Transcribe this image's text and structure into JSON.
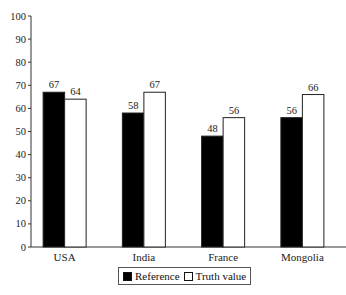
{
  "chart_data": {
    "type": "bar",
    "title": "",
    "xlabel": "",
    "ylabel": "",
    "categories": [
      "USA",
      "India",
      "France",
      "Mongolia"
    ],
    "series": [
      {
        "name": "Reference",
        "values": [
          67,
          58,
          48,
          56
        ],
        "color": "#000000"
      },
      {
        "name": "Truth value",
        "values": [
          64,
          67,
          56,
          66
        ],
        "color": "#ffffff"
      }
    ],
    "ylim": [
      0,
      100
    ],
    "yticks": [
      0,
      10,
      20,
      30,
      40,
      50,
      60,
      70,
      80,
      90,
      100
    ],
    "grid": false,
    "legend_position": "bottom",
    "data_labels": true
  },
  "legend": {
    "items": [
      {
        "label": "Reference",
        "color": "#000000"
      },
      {
        "label": "Truth value",
        "color": "#ffffff"
      }
    ]
  }
}
